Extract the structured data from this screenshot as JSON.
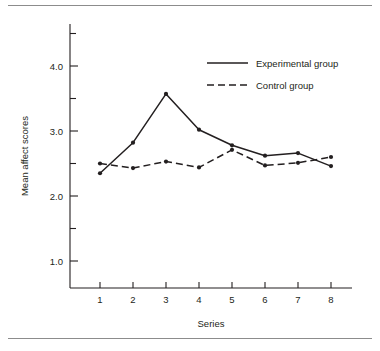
{
  "chart_data": {
    "type": "line",
    "title": "",
    "xlabel": "Series",
    "ylabel": "Mean affect scores",
    "categories": [
      "1",
      "2",
      "3",
      "4",
      "5",
      "6",
      "7",
      "8"
    ],
    "x": [
      1,
      2,
      3,
      4,
      5,
      6,
      7,
      8
    ],
    "xlim": [
      0.6,
      8.5
    ],
    "ylim": [
      0.75,
      4.65
    ],
    "yticks": [
      1.0,
      1.5,
      2.0,
      2.5,
      3.0,
      3.5,
      4.0,
      4.5
    ],
    "ytick_labels": [
      "1.0",
      "",
      "2.0",
      "",
      "3.0",
      "",
      "4.0",
      ""
    ],
    "grid": false,
    "legend_position": "upper-right-inside",
    "series": [
      {
        "name": "Experimental group",
        "style": "solid",
        "marker": "circle",
        "color": "#231f20",
        "values": [
          2.35,
          2.82,
          3.57,
          3.02,
          2.78,
          2.62,
          2.66,
          2.46
        ]
      },
      {
        "name": "Control group",
        "style": "dashed",
        "marker": "circle",
        "color": "#231f20",
        "values": [
          2.5,
          2.43,
          2.53,
          2.44,
          2.71,
          2.47,
          2.51,
          2.6
        ]
      }
    ]
  },
  "figure": {
    "background": "#ffffff",
    "axis_color": "#231f20",
    "rule_color": "#8c8c8c"
  }
}
